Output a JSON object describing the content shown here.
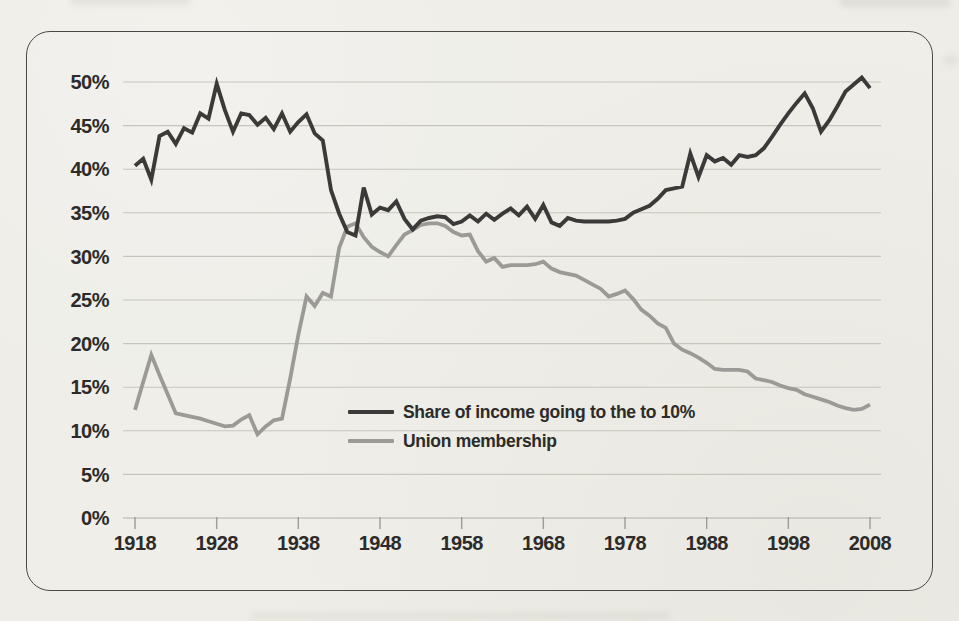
{
  "figure": {
    "paper_color": "#eeede7",
    "frame_border_color": "#4a4947",
    "grid_color": "#c7c5be",
    "text_color": "#2c2b29"
  },
  "chart_data": {
    "type": "line",
    "title": "",
    "xlabel": "",
    "ylabel": "",
    "ylim": [
      0,
      50
    ],
    "y_tick_step": 5,
    "y_tick_labels": [
      "0%",
      "5%",
      "10%",
      "15%",
      "20%",
      "25%",
      "30%",
      "35%",
      "40%",
      "45%",
      "50%"
    ],
    "x_tick_years": [
      1918,
      1928,
      1938,
      1948,
      1958,
      1968,
      1978,
      1988,
      1998,
      2008
    ],
    "grid": true,
    "legend_position": "inside-lower-middle",
    "years": [
      1918,
      1919,
      1920,
      1921,
      1922,
      1923,
      1924,
      1925,
      1926,
      1927,
      1928,
      1929,
      1930,
      1931,
      1932,
      1933,
      1934,
      1935,
      1936,
      1937,
      1938,
      1939,
      1940,
      1941,
      1942,
      1943,
      1944,
      1945,
      1946,
      1947,
      1948,
      1949,
      1950,
      1951,
      1952,
      1953,
      1954,
      1955,
      1956,
      1957,
      1958,
      1959,
      1960,
      1961,
      1962,
      1963,
      1964,
      1965,
      1966,
      1967,
      1968,
      1969,
      1970,
      1971,
      1972,
      1973,
      1974,
      1975,
      1976,
      1977,
      1978,
      1979,
      1980,
      1981,
      1982,
      1983,
      1984,
      1985,
      1986,
      1987,
      1988,
      1989,
      1990,
      1991,
      1992,
      1993,
      1994,
      1995,
      1996,
      1997,
      1998,
      1999,
      2000,
      2001,
      2002,
      2003,
      2004,
      2005,
      2006,
      2007,
      2008
    ],
    "series": [
      {
        "name": "Share of income going to the to 10%",
        "color": "#3b3a38",
        "values": [
          40.4,
          41.2,
          38.8,
          43.8,
          44.3,
          42.9,
          44.7,
          44.2,
          46.4,
          45.8,
          49.8,
          46.8,
          44.3,
          46.4,
          46.2,
          45.1,
          45.9,
          44.6,
          46.4,
          44.3,
          45.4,
          46.3,
          44.1,
          43.3,
          37.6,
          34.9,
          32.8,
          32.4,
          37.9,
          34.8,
          35.6,
          35.3,
          36.3,
          34.3,
          33.1,
          34.1,
          34.4,
          34.6,
          34.5,
          33.7,
          34.0,
          34.7,
          34.0,
          34.9,
          34.2,
          34.9,
          35.5,
          34.7,
          35.7,
          34.3,
          35.9,
          33.9,
          33.5,
          34.4,
          34.1,
          34.0,
          34.0,
          34.0,
          34.0,
          34.1,
          34.3,
          35.0,
          35.4,
          35.8,
          36.6,
          37.6,
          37.8,
          38.0,
          41.8,
          39.1,
          41.6,
          40.9,
          41.3,
          40.5,
          41.6,
          41.4,
          41.6,
          42.4,
          43.7,
          45.1,
          46.4,
          47.6,
          48.7,
          47.0,
          44.3,
          45.6,
          47.2,
          48.9,
          49.7,
          50.5,
          49.3
        ]
      },
      {
        "name": "Union membership",
        "color": "#9b9a96",
        "values": [
          12.4,
          15.6,
          18.7,
          16.4,
          14.2,
          12.0,
          11.8,
          11.6,
          11.4,
          11.1,
          10.8,
          10.5,
          10.6,
          11.3,
          11.8,
          9.6,
          10.5,
          11.2,
          11.4,
          16.0,
          21.0,
          25.4,
          24.3,
          25.8,
          25.4,
          31.0,
          33.4,
          33.8,
          32.2,
          31.1,
          30.5,
          30.0,
          31.3,
          32.5,
          33.0,
          33.6,
          33.8,
          33.8,
          33.5,
          32.8,
          32.4,
          32.5,
          30.6,
          29.4,
          29.8,
          28.8,
          29.0,
          29.0,
          29.0,
          29.1,
          29.4,
          28.6,
          28.2,
          28.0,
          27.8,
          27.3,
          26.8,
          26.3,
          25.4,
          25.7,
          26.1,
          25.1,
          23.9,
          23.2,
          22.3,
          21.8,
          20.0,
          19.3,
          18.9,
          18.4,
          17.8,
          17.1,
          17.0,
          17.0,
          17.0,
          16.8,
          16.0,
          15.8,
          15.6,
          15.2,
          14.9,
          14.7,
          14.2,
          13.9,
          13.6,
          13.3,
          12.9,
          12.6,
          12.4,
          12.5,
          13.0
        ]
      }
    ]
  }
}
